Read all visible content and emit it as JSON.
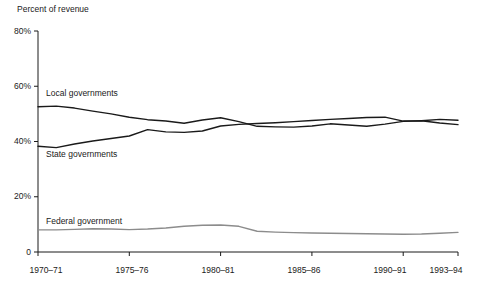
{
  "chart_data": {
    "type": "line",
    "title": "",
    "ylabel": "Percent of revenue",
    "xlabel": "",
    "ylim": [
      0,
      80
    ],
    "grid": false,
    "legend_position": "inline-labels",
    "ytick_labels": [
      "80%",
      "60%",
      "40%",
      "20%",
      "0"
    ],
    "ytick_values": [
      80,
      60,
      40,
      20,
      0
    ],
    "xtick_labels": [
      "1970–71",
      "1975–76",
      "1980–81",
      "1985–86",
      "1990–91",
      "1993–94"
    ],
    "xtick_values": [
      1970,
      1975,
      1980,
      1985,
      1990,
      1993
    ],
    "x": [
      1970,
      1971,
      1972,
      1973,
      1974,
      1975,
      1976,
      1977,
      1978,
      1979,
      1980,
      1981,
      1982,
      1983,
      1984,
      1985,
      1986,
      1987,
      1988,
      1989,
      1990,
      1991,
      1992,
      1993
    ],
    "series": [
      {
        "name": "Local governments",
        "color": "#1a1a1a",
        "values": [
          52.6,
          52.8,
          52.1,
          51.0,
          50.0,
          48.8,
          47.9,
          47.4,
          46.6,
          47.8,
          48.6,
          47.2,
          45.5,
          45.3,
          45.2,
          45.6,
          46.4,
          46.0,
          45.5,
          46.3,
          47.3,
          47.5,
          46.7,
          46.1
        ]
      },
      {
        "name": "State governments",
        "color": "#1a1a1a",
        "values": [
          38.3,
          37.8,
          39.1,
          40.2,
          41.1,
          42.0,
          44.3,
          43.5,
          43.3,
          43.8,
          45.6,
          46.2,
          46.5,
          46.8,
          47.2,
          47.6,
          48.0,
          48.3,
          48.7,
          48.8,
          47.4,
          47.5,
          48.0,
          47.7
        ]
      },
      {
        "name": "Federal government",
        "color": "#8c8c8c",
        "values": [
          8.0,
          8.0,
          8.2,
          8.4,
          8.3,
          8.1,
          8.3,
          8.7,
          9.3,
          9.7,
          9.8,
          9.3,
          7.5,
          7.2,
          7.0,
          6.9,
          6.8,
          6.7,
          6.6,
          6.5,
          6.4,
          6.5,
          6.8,
          7.1
        ]
      }
    ],
    "series_label_positions": [
      {
        "name": "Local governments",
        "x": 46,
        "y": 92
      },
      {
        "name": "State governments",
        "x": 46,
        "y": 153
      },
      {
        "name": "Federal government",
        "x": 46,
        "y": 220
      }
    ]
  }
}
